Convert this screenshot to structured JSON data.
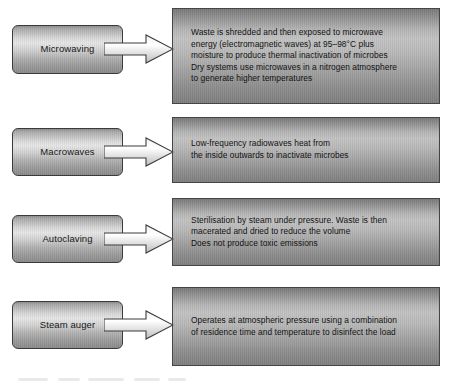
{
  "diagram": {
    "colors": {
      "box_border": "#3a3a3a",
      "panel_border": "#454545",
      "text": "#111111",
      "background": "#ffffff"
    },
    "rows": [
      {
        "label": "Microwaving",
        "arrow_icon": "right-arrow-icon",
        "description": "Waste is shredded and then exposed to microwave\nenergy (electromagnetic waves) at 95–98°C plus\n moisture to produce thermal inactivation of microbes\nDry systems use microwaves in a nitrogen atmosphere\nto generate higher temperatures"
      },
      {
        "label": "Macrowaves",
        "arrow_icon": "right-arrow-icon",
        "description": "Low-frequency radiowaves heat from\nthe inside outwards to inactivate microbes"
      },
      {
        "label": "Autoclaving",
        "arrow_icon": "right-arrow-icon",
        "description": "Sterilisation by steam under pressure. Waste is then\nmacerated and dried to reduce the volume\nDoes not produce toxic emissions"
      },
      {
        "label": "Steam auger",
        "arrow_icon": "right-arrow-icon",
        "description": "Operates at atmospheric pressure using a combination\nof residence time and temperature to disinfect the load"
      }
    ]
  }
}
